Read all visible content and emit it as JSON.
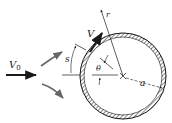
{
  "diagram": {
    "labels": {
      "free_stream_velocity": "V",
      "free_stream_subscript": "0",
      "surface_velocity": "V",
      "arc_length": "s",
      "angle": "θ",
      "radius": "a",
      "radial_coordinate": "r"
    },
    "colors": {
      "ink": "#1a1a1a",
      "flow_arrows": "#555555",
      "background": "#ffffff"
    }
  }
}
